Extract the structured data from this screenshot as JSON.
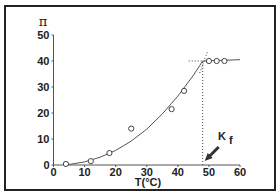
{
  "chart_data": {
    "type": "scatter",
    "title": "",
    "xlabel": "T(°C)",
    "ylabel": "π",
    "xlim": [
      0,
      60
    ],
    "ylim": [
      0,
      50
    ],
    "x_ticks": [
      "0",
      "10",
      "20",
      "30",
      "40",
      "50",
      "60"
    ],
    "y_ticks": [
      "0",
      "10",
      "20",
      "30",
      "40",
      "50"
    ],
    "grid": false,
    "legend": null,
    "series": [
      {
        "name": "measured",
        "marker": "open-circle",
        "x": [
          4,
          12,
          18,
          25,
          38,
          42,
          50,
          52.5,
          55
        ],
        "y": [
          0.4,
          1.5,
          4.6,
          14,
          21.5,
          28.5,
          40,
          40,
          40
        ]
      },
      {
        "name": "fit-curve",
        "style": "solid-line",
        "x": [
          4,
          10,
          15,
          20,
          25,
          30,
          35,
          40,
          45,
          48
        ],
        "y": [
          0,
          1.2,
          3.0,
          5.6,
          9.2,
          13.8,
          19.6,
          26.5,
          34.5,
          40
        ]
      },
      {
        "name": "plateau",
        "style": "solid-line",
        "x": [
          48,
          60
        ],
        "y": [
          40,
          40.5
        ]
      }
    ],
    "annotations": [
      {
        "type": "vertical-dotted-line",
        "x": 48,
        "y_range": [
          0,
          40
        ]
      },
      {
        "type": "horizontal-dotted-line",
        "y": 40,
        "x_range": [
          43.5,
          48
        ]
      },
      {
        "type": "tangent-dotted-line",
        "near_x": 48
      },
      {
        "type": "arrow",
        "text": "K",
        "subscript": "f",
        "points_to_x": 48
      }
    ]
  },
  "labels": {
    "y_axis_symbol": "π",
    "x_axis_title": "T(°C)",
    "annotation_main": "K",
    "annotation_sub": "f"
  }
}
